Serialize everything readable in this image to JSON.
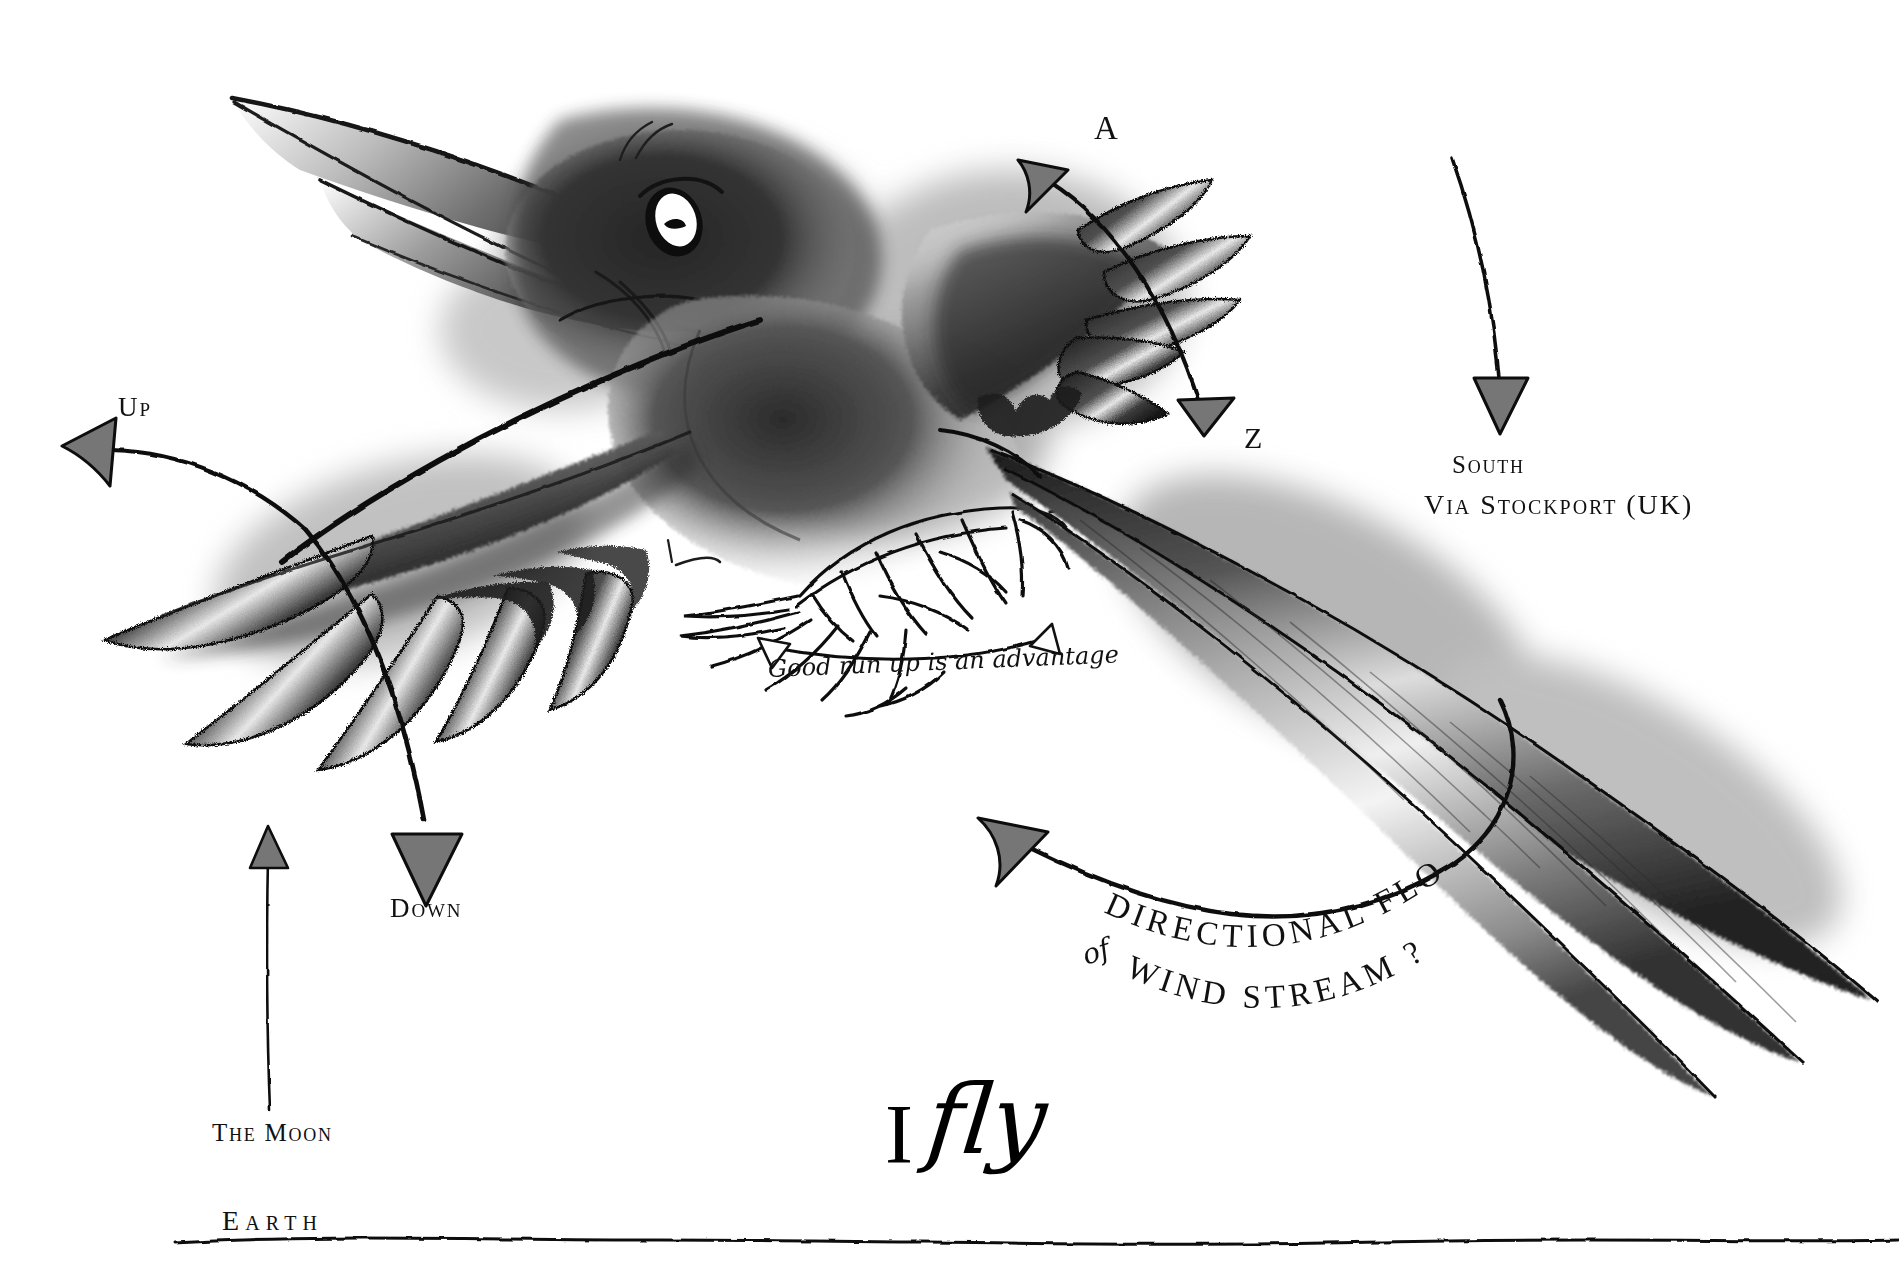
{
  "artwork": {
    "title": "I fly",
    "subject": "charcoal drawing of a flying bird with hand-lettered flight diagram annotations",
    "medium": "charcoal and ink on white paper",
    "background_color": "#ffffff",
    "ink_color": "#111111",
    "arrow_fill_color": "#767676",
    "shade_dark": "#1a1a1a",
    "shade_mid": "#4a4a4a",
    "shade_light": "#9a9a9a"
  },
  "signature": {
    "initial": "I",
    "word": "fly"
  },
  "annotations": {
    "up": "Up",
    "down": "Down",
    "a": "A",
    "z": "Z",
    "south": "South",
    "via_stockport": "Via Stockport (UK)",
    "run_up": "Good run up is an advantage",
    "the_moon": "The Moon",
    "earth": "Earth"
  },
  "wind_stream": {
    "line1": "Directional Flow",
    "line2_prefix": "of",
    "line2": "Wind Stream ?",
    "curved_chars_line1": [
      "D",
      "I",
      "R",
      "E",
      "C",
      "T",
      "I",
      "O",
      "N",
      "A",
      "L",
      " ",
      "F",
      "L",
      "O",
      "W"
    ],
    "curved_chars_line2": [
      "W",
      "I",
      "N",
      "D",
      " ",
      "S",
      "T",
      "R",
      "E",
      "A",
      "M",
      " ",
      "?"
    ]
  },
  "arrows": [
    {
      "id": "up-arrow",
      "label": "Up",
      "direction": "left",
      "style": "curved-tapered"
    },
    {
      "id": "down-arrow",
      "label": "Down",
      "direction": "down",
      "style": "curved-tapered"
    },
    {
      "id": "a-arrow",
      "label": "A",
      "direction": "upper-left",
      "style": "concave-head"
    },
    {
      "id": "z-arrow",
      "label": "Z",
      "direction": "down",
      "style": "straight-head"
    },
    {
      "id": "south-arrow",
      "label": "South Via Stockport (UK)",
      "direction": "down",
      "style": "long-curve"
    },
    {
      "id": "moon-arrow",
      "label": "The Moon",
      "direction": "up",
      "style": "thin-vertical"
    },
    {
      "id": "wind-arrow",
      "label": "Directional Flow of Wind Stream ?",
      "direction": "upper-left",
      "style": "concave-head"
    },
    {
      "id": "runup-arrow",
      "label": "Good run up is an advantage",
      "direction": "both",
      "style": "double-headed-open"
    }
  ],
  "bird": {
    "parts": [
      "beak",
      "head",
      "eye",
      "body",
      "left-wing",
      "left-wing-primaries",
      "right-wing",
      "right-wing-primaries",
      "feet",
      "tail-feathers"
    ],
    "eye_color": "#ffffff",
    "primary_feather_count_left": 5,
    "primary_feather_count_right": 5,
    "tail_feather_count": 3
  }
}
